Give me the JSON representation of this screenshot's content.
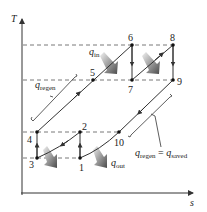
{
  "diagram": {
    "title": "",
    "type": "T-s diagram, regenerative gas-turbine cycle with intercooling and reheating",
    "axes": {
      "y_label": "T",
      "x_label": "s"
    },
    "points": [
      {
        "id": "1",
        "label": "1"
      },
      {
        "id": "2",
        "label": "2"
      },
      {
        "id": "3",
        "label": "3"
      },
      {
        "id": "4",
        "label": "4"
      },
      {
        "id": "5",
        "label": "5"
      },
      {
        "id": "6",
        "label": "6"
      },
      {
        "id": "7",
        "label": "7"
      },
      {
        "id": "8",
        "label": "8"
      },
      {
        "id": "9",
        "label": "9"
      },
      {
        "id": "10",
        "label": "10"
      }
    ],
    "heat_labels": {
      "q_in": {
        "base": "q",
        "sub": "in"
      },
      "q_out": {
        "base": "q",
        "sub": "out"
      },
      "q_regen_left": {
        "base": "q",
        "sub": "regen"
      },
      "q_regen_right": {
        "base": "q",
        "sub": "regen",
        "equals": " = ",
        "base2": "q",
        "sub2": "saved"
      }
    },
    "colors": {
      "line": "#333333",
      "dashed": "#555555",
      "arrow_dark": "#555555",
      "arrow_light": "#e6e6e6"
    }
  }
}
